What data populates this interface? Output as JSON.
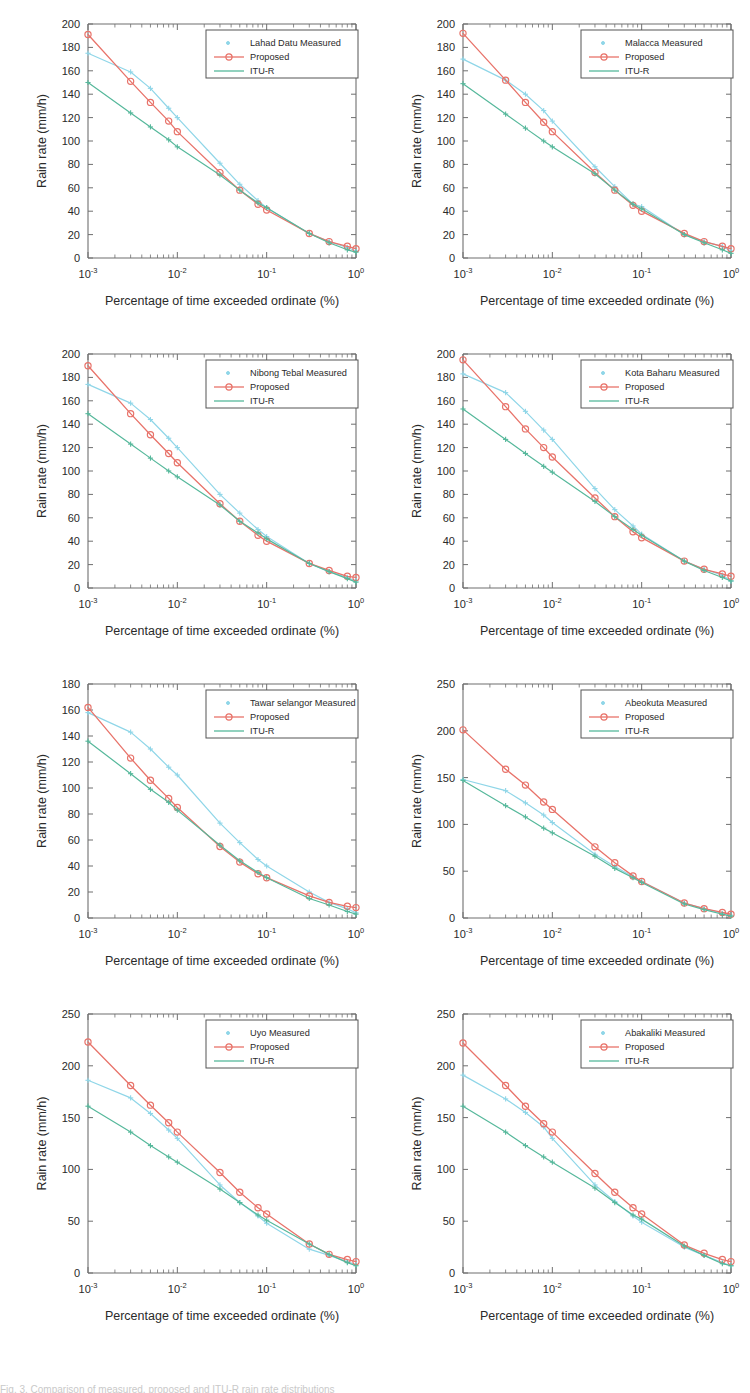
{
  "figure": {
    "rows": 4,
    "columns": 2,
    "caption_fragment": "Fig. 3.  Comparison of measured, proposed and ITU-R rain rate distributions"
  },
  "common": {
    "xlabel": "Percentage of time exceeded ordinate (%)",
    "ylabel": "Rain rate (mm/h)",
    "xscale": "log",
    "xlim": [
      0.001,
      1
    ],
    "xtick_labels": [
      "10⁻³",
      "10⁻²",
      "10⁻¹",
      "10⁰"
    ],
    "xtick_bases": [
      "10",
      "10",
      "10",
      "10"
    ],
    "xtick_exponents": [
      "-3",
      "-2",
      "-1",
      "0"
    ],
    "legend_entries": [
      {
        "label": "Proposed",
        "marker": "circle-line",
        "color": "#e8736a"
      },
      {
        "label": "ITU-R",
        "marker": "line",
        "color": "#56b89b"
      }
    ],
    "colors": {
      "measured": "#8fd6e8",
      "proposed": "#e8736a",
      "itur": "#56b89b",
      "axis": "#6f6f6f",
      "text": "#2a2a2a",
      "background": "#ffffff"
    }
  },
  "chart_data": [
    {
      "type": "line",
      "panel_index": 0,
      "position": "row1-left",
      "title": "",
      "location": "Lahad Datu",
      "legend": [
        "Lahad Datu Measured",
        "Proposed",
        "ITU-R"
      ],
      "xlabel": "Percentage of time exceeded ordinate (%)",
      "ylabel": "Rain rate (mm/h)",
      "xscale": "log",
      "xlim": [
        0.001,
        1
      ],
      "ylim": [
        0,
        200
      ],
      "ytick_step": 20,
      "yticks": [
        0,
        20,
        40,
        60,
        80,
        100,
        120,
        140,
        160,
        180,
        200
      ],
      "grid": false,
      "legend_position": "top-right",
      "x": [
        0.001,
        0.003,
        0.005,
        0.008,
        0.01,
        0.03,
        0.05,
        0.08,
        0.1,
        0.3,
        0.5,
        0.8,
        1.0
      ],
      "series": [
        {
          "name": "Lahad Datu Measured",
          "marker": "plus",
          "color": "#8fd6e8",
          "values": [
            175,
            159,
            145,
            128,
            120,
            81,
            63,
            49,
            43,
            21,
            14,
            9,
            6
          ]
        },
        {
          "name": "Proposed",
          "marker": "circle",
          "color": "#e8736a",
          "values": [
            191,
            151,
            133,
            117,
            108,
            73,
            58,
            46,
            41,
            21,
            14,
            10,
            8
          ]
        },
        {
          "name": "ITU-R",
          "marker": "plus",
          "color": "#56b89b",
          "values": [
            150,
            124,
            112,
            101,
            95,
            71,
            58,
            47,
            43,
            21,
            13,
            7,
            5
          ]
        }
      ]
    },
    {
      "type": "line",
      "panel_index": 1,
      "position": "row1-right",
      "title": "",
      "location": "Malacca",
      "legend": [
        "Malacca Measured",
        "Proposed",
        "ITU-R"
      ],
      "xlabel": "Percentage of time exceeded ordinate (%)",
      "ylabel": "Rain rate (mm/h)",
      "xscale": "log",
      "xlim": [
        0.001,
        1
      ],
      "ylim": [
        0,
        200
      ],
      "ytick_step": 20,
      "yticks": [
        0,
        20,
        40,
        60,
        80,
        100,
        120,
        140,
        160,
        180,
        200
      ],
      "grid": false,
      "legend_position": "top-right",
      "x": [
        0.001,
        0.003,
        0.005,
        0.008,
        0.01,
        0.03,
        0.05,
        0.08,
        0.1,
        0.3,
        0.5,
        0.8,
        1.0
      ],
      "series": [
        {
          "name": "Malacca Measured",
          "marker": "plus",
          "color": "#8fd6e8",
          "values": [
            170,
            152,
            140,
            126,
            117,
            78,
            61,
            46,
            44,
            20,
            14,
            10,
            6
          ]
        },
        {
          "name": "Proposed",
          "marker": "circle",
          "color": "#e8736a",
          "values": [
            192,
            152,
            133,
            116,
            108,
            73,
            58,
            45,
            40,
            21,
            14,
            10,
            8
          ]
        },
        {
          "name": "ITU-R",
          "marker": "plus",
          "color": "#56b89b",
          "values": [
            149,
            123,
            111,
            100,
            95,
            72,
            58,
            46,
            42,
            20,
            13,
            7,
            4
          ]
        }
      ]
    },
    {
      "type": "line",
      "panel_index": 2,
      "position": "row2-left",
      "title": "",
      "location": "Nibong Tebal",
      "legend": [
        "Nibong Tebal Measured",
        "Proposed",
        "ITU-R"
      ],
      "xlabel": "Percentage of time exceeded ordinate (%)",
      "ylabel": "Rain rate (mm/h)",
      "xscale": "log",
      "xlim": [
        0.001,
        1
      ],
      "ylim": [
        0,
        200
      ],
      "ytick_step": 20,
      "yticks": [
        0,
        20,
        40,
        60,
        80,
        100,
        120,
        140,
        160,
        180,
        200
      ],
      "grid": false,
      "legend_position": "top-right",
      "x": [
        0.001,
        0.003,
        0.005,
        0.008,
        0.01,
        0.03,
        0.05,
        0.08,
        0.1,
        0.3,
        0.5,
        0.8,
        1.0
      ],
      "series": [
        {
          "name": "Nibong Tebal Measured",
          "marker": "plus",
          "color": "#8fd6e8",
          "values": [
            174,
            158,
            144,
            128,
            120,
            80,
            64,
            50,
            44,
            21,
            14,
            9,
            6
          ]
        },
        {
          "name": "Proposed",
          "marker": "circle",
          "color": "#e8736a",
          "values": [
            190,
            149,
            131,
            115,
            107,
            72,
            57,
            45,
            40,
            21,
            15,
            10,
            9
          ]
        },
        {
          "name": "ITU-R",
          "marker": "plus",
          "color": "#56b89b",
          "values": [
            149,
            123,
            111,
            100,
            95,
            71,
            57,
            47,
            42,
            21,
            14,
            8,
            5
          ]
        }
      ]
    },
    {
      "type": "line",
      "panel_index": 3,
      "position": "row2-right",
      "title": "",
      "location": "Kota Baharu",
      "legend": [
        "Kota Baharu Measured",
        "Proposed",
        "ITU-R"
      ],
      "xlabel": "Percentage of time exceeded ordinate (%)",
      "ylabel": "Rain rate (mm/h)",
      "xscale": "log",
      "xlim": [
        0.001,
        1
      ],
      "ylim": [
        0,
        200
      ],
      "ytick_step": 20,
      "yticks": [
        0,
        20,
        40,
        60,
        80,
        100,
        120,
        140,
        160,
        180,
        200
      ],
      "grid": false,
      "legend_position": "top-right",
      "x": [
        0.001,
        0.003,
        0.005,
        0.008,
        0.01,
        0.03,
        0.05,
        0.08,
        0.1,
        0.3,
        0.5,
        0.8,
        1.0
      ],
      "series": [
        {
          "name": "Kota Baharu Measured",
          "marker": "plus",
          "color": "#8fd6e8",
          "values": [
            183,
            167,
            151,
            135,
            127,
            85,
            67,
            53,
            46,
            23,
            16,
            11,
            6
          ]
        },
        {
          "name": "Proposed",
          "marker": "circle",
          "color": "#e8736a",
          "values": [
            195,
            155,
            136,
            120,
            112,
            77,
            61,
            48,
            43,
            23,
            16,
            12,
            10
          ]
        },
        {
          "name": "ITU-R",
          "marker": "plus",
          "color": "#56b89b",
          "values": [
            153,
            127,
            115,
            104,
            99,
            74,
            61,
            50,
            45,
            23,
            15,
            9,
            6
          ]
        }
      ]
    },
    {
      "type": "line",
      "panel_index": 4,
      "position": "row3-left",
      "title": "",
      "location": "Tawar selangor",
      "legend": [
        "Tawar selangor Measured",
        "Proposed",
        "ITU-R"
      ],
      "xlabel": "Percentage of time exceeded ordinate (%)",
      "ylabel": "Rain rate (mm/h)",
      "xscale": "log",
      "xlim": [
        0.001,
        1
      ],
      "ylim": [
        0,
        180
      ],
      "ytick_step": 20,
      "yticks": [
        0,
        20,
        40,
        60,
        80,
        100,
        120,
        140,
        160,
        180
      ],
      "grid": false,
      "legend_position": "top-right",
      "x": [
        0.001,
        0.003,
        0.005,
        0.008,
        0.01,
        0.03,
        0.05,
        0.08,
        0.1,
        0.3,
        0.5,
        0.8,
        1.0
      ],
      "series": [
        {
          "name": "Tawar selangor Measured",
          "marker": "plus",
          "color": "#8fd6e8",
          "values": [
            158,
            143,
            130,
            116,
            110,
            73,
            58,
            45,
            40,
            20,
            12,
            7,
            4
          ]
        },
        {
          "name": "Proposed",
          "marker": "circle",
          "color": "#e8736a",
          "values": [
            162,
            123,
            106,
            92,
            85,
            55,
            43,
            34,
            31,
            17,
            12,
            9,
            8
          ]
        },
        {
          "name": "ITU-R",
          "marker": "plus",
          "color": "#56b89b",
          "values": [
            136,
            111,
            99,
            89,
            83,
            56,
            44,
            35,
            31,
            15,
            10,
            5,
            3
          ]
        }
      ]
    },
    {
      "type": "line",
      "panel_index": 5,
      "position": "row3-right",
      "title": "",
      "location": "Abeokuta",
      "legend": [
        "Abeokuta Measured",
        "Proposed",
        "ITU-R"
      ],
      "xlabel": "Percentage of time exceeded ordinate (%)",
      "ylabel": "Rain rate (mm/h)",
      "xscale": "log",
      "xlim": [
        0.001,
        1
      ],
      "ylim": [
        0,
        250
      ],
      "ytick_step": 50,
      "yticks": [
        0,
        50,
        100,
        150,
        200,
        250
      ],
      "grid": false,
      "legend_position": "top-right",
      "x": [
        0.001,
        0.003,
        0.005,
        0.008,
        0.01,
        0.03,
        0.05,
        0.08,
        0.1,
        0.3,
        0.5,
        0.8,
        1.0
      ],
      "series": [
        {
          "name": "Abeokuta Measured",
          "marker": "plus",
          "color": "#8fd6e8",
          "values": [
            148,
            136,
            123,
            110,
            102,
            68,
            55,
            44,
            39,
            16,
            10,
            5,
            3
          ]
        },
        {
          "name": "Proposed",
          "marker": "circle",
          "color": "#e8736a",
          "values": [
            201,
            159,
            142,
            124,
            116,
            76,
            59,
            45,
            39,
            16,
            10,
            6,
            4
          ]
        },
        {
          "name": "ITU-R",
          "marker": "plus",
          "color": "#56b89b",
          "values": [
            147,
            120,
            108,
            96,
            91,
            66,
            53,
            43,
            38,
            15,
            9,
            4,
            2
          ]
        }
      ]
    },
    {
      "type": "line",
      "panel_index": 6,
      "position": "row4-left",
      "title": "",
      "location": "Uyo",
      "legend": [
        "Uyo Measured",
        "Proposed",
        "ITU-R"
      ],
      "xlabel": "Percentage of time exceeded ordinate (%)",
      "ylabel": "Rain rate (mm/h)",
      "xscale": "log",
      "xlim": [
        0.001,
        1
      ],
      "ylim": [
        0,
        250
      ],
      "ytick_step": 50,
      "yticks": [
        0,
        50,
        100,
        150,
        200,
        250
      ],
      "grid": false,
      "legend_position": "top-right",
      "x": [
        0.001,
        0.003,
        0.005,
        0.008,
        0.01,
        0.03,
        0.05,
        0.08,
        0.1,
        0.3,
        0.5,
        0.8,
        1.0
      ],
      "series": [
        {
          "name": "Uyo Measured",
          "marker": "plus",
          "color": "#8fd6e8",
          "values": [
            186,
            169,
            154,
            138,
            130,
            85,
            68,
            55,
            48,
            23,
            17,
            11,
            8
          ]
        },
        {
          "name": "Proposed",
          "marker": "circle",
          "color": "#e8736a",
          "values": [
            223,
            181,
            162,
            145,
            136,
            97,
            78,
            63,
            57,
            28,
            18,
            13,
            11
          ]
        },
        {
          "name": "ITU-R",
          "marker": "plus",
          "color": "#56b89b",
          "values": [
            161,
            136,
            123,
            112,
            107,
            81,
            68,
            56,
            51,
            28,
            18,
            10,
            7
          ]
        }
      ]
    },
    {
      "type": "line",
      "panel_index": 7,
      "position": "row4-right",
      "title": "",
      "location": "Abakaliki",
      "legend": [
        "Abakaliki Measured",
        "Proposed",
        "ITU-R"
      ],
      "xlabel": "Percentage of time exceeded ordinate (%)",
      "ylabel": "Rain rate (mm/h)",
      "xscale": "log",
      "xlim": [
        0.001,
        1
      ],
      "ylim": [
        0,
        250
      ],
      "ytick_step": 50,
      "yticks": [
        0,
        50,
        100,
        150,
        200,
        250
      ],
      "grid": false,
      "legend_position": "top-right",
      "x": [
        0.001,
        0.003,
        0.005,
        0.008,
        0.01,
        0.03,
        0.05,
        0.08,
        0.1,
        0.3,
        0.5,
        0.8,
        1.0
      ],
      "series": [
        {
          "name": "Abakaliki Measured",
          "marker": "plus",
          "color": "#8fd6e8",
          "values": [
            191,
            168,
            155,
            141,
            130,
            85,
            69,
            55,
            49,
            25,
            17,
            10,
            7
          ]
        },
        {
          "name": "Proposed",
          "marker": "circle",
          "color": "#e8736a",
          "values": [
            222,
            181,
            161,
            144,
            136,
            96,
            78,
            63,
            57,
            27,
            19,
            13,
            11
          ]
        },
        {
          "name": "ITU-R",
          "marker": "plus",
          "color": "#56b89b",
          "values": [
            161,
            136,
            123,
            112,
            107,
            82,
            68,
            56,
            52,
            26,
            17,
            9,
            7
          ]
        }
      ]
    }
  ]
}
